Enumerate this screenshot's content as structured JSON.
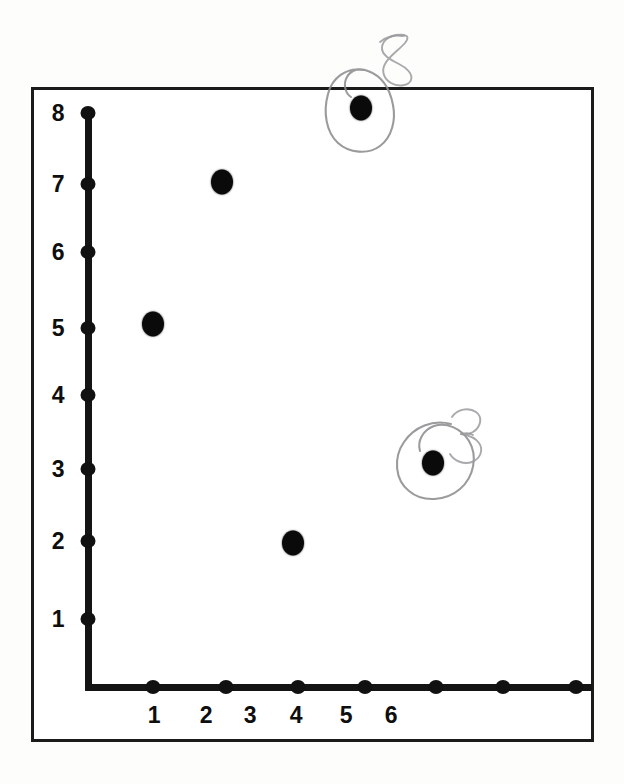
{
  "document": {
    "kind": "scanned-worksheet",
    "background_color": "#fdfdfc",
    "ink_color": "#111111",
    "pencil_color": "#8d8d90"
  },
  "chart_data": {
    "type": "scatter",
    "title": "",
    "subtitle": "",
    "xlabel": "",
    "ylabel": "",
    "grid": false,
    "legend": false,
    "xlim": [
      0,
      7
    ],
    "ylim": [
      0,
      8
    ],
    "x_tick_labels": [
      "1",
      "2",
      "3",
      "4",
      "5",
      "6"
    ],
    "y_tick_labels": [
      "8",
      "7",
      "6",
      "5",
      "4",
      "3",
      "2",
      "1"
    ],
    "x_tick_count": 7,
    "y_tick_count": 8,
    "points": [
      {
        "label": "",
        "x": 1,
        "y": 5,
        "px": 150,
        "py": 321,
        "circled": false
      },
      {
        "label": "",
        "x": 2,
        "y": 7,
        "px": 219,
        "py": 179,
        "circled": false
      },
      {
        "label": "",
        "x": 4,
        "y": 2,
        "px": 290,
        "py": 540,
        "circled": false
      },
      {
        "label": "8",
        "x": 5,
        "y": 8,
        "px": 358,
        "py": 105,
        "circled": true
      },
      {
        "label": "3",
        "x": 6,
        "y": 3,
        "px": 430,
        "py": 460,
        "circled": true
      }
    ],
    "annotations": [
      {
        "text": "8",
        "kind": "handwritten-pencil",
        "px": 389,
        "py": 58
      },
      {
        "text": "3",
        "kind": "handwritten-pencil",
        "px": 461,
        "py": 432
      }
    ]
  },
  "axes": {
    "x_ticks": [
      {
        "value": "",
        "px": 150
      },
      {
        "value": "",
        "px": 223
      },
      {
        "value": "",
        "px": 295
      },
      {
        "value": "",
        "px": 362
      },
      {
        "value": "",
        "px": 433
      },
      {
        "value": "",
        "px": 500
      },
      {
        "value": "",
        "px": 573
      }
    ],
    "x_labels": [
      {
        "text": "1",
        "px": 151
      },
      {
        "text": "2",
        "px": 203
      },
      {
        "text": "3",
        "px": 247
      },
      {
        "text": "4",
        "px": 293
      },
      {
        "text": "5",
        "px": 343
      },
      {
        "text": "6",
        "px": 388
      }
    ],
    "y_ticks": [
      {
        "text": "8",
        "py": 110
      },
      {
        "text": "7",
        "py": 181
      },
      {
        "text": "6",
        "py": 249
      },
      {
        "text": "5",
        "py": 325
      },
      {
        "text": "4",
        "py": 392
      },
      {
        "text": "3",
        "py": 466
      },
      {
        "text": "2",
        "py": 538
      },
      {
        "text": "1",
        "py": 616
      }
    ],
    "y_label_x": 55,
    "origin_px": 85,
    "origin_py": 684
  }
}
